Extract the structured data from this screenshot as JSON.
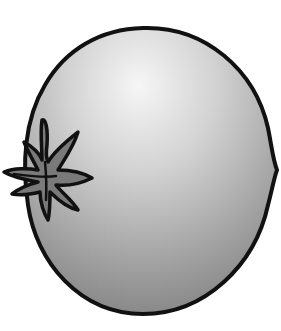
{
  "image": {
    "subject": "tomato",
    "style": "grayscale cartoon illustration",
    "colors": {
      "background": "#ffffff",
      "outline": "#111111",
      "highlight": "#f4f4f4",
      "shade_mid": "#b8b8b8",
      "shade_dark": "#858585",
      "stem_fill": "#7a7a7a"
    }
  }
}
